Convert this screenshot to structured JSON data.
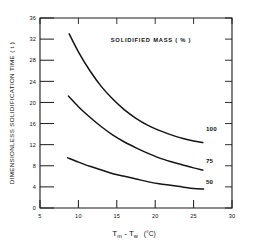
{
  "chart_data": {
    "type": "line",
    "title": "SOLIDIFIED MASS  ( % )",
    "xlabel_main": "T",
    "xlabel_sub1": "m",
    "xlabel_dash": " - T",
    "xlabel_sub2": "w",
    "xlabel_unit": "(°C)",
    "xlabel_full": "Tm - Tw  (°C)",
    "ylabel": "DIMENSIONLESS SOLIDIFICATION TIME ( t )",
    "xlim": [
      5,
      30
    ],
    "ylim": [
      0,
      36
    ],
    "grid": false,
    "legend_position": "inline-right-of-curve-ends",
    "xticks": [
      5,
      10,
      15,
      20,
      25,
      30
    ],
    "xtick_labels": [
      "5",
      "10",
      "15",
      "20",
      "25",
      "30"
    ],
    "yticks": [
      0,
      4,
      8,
      12,
      16,
      20,
      24,
      28,
      32,
      36
    ],
    "ytick_labels": [
      "0",
      "4",
      "8",
      "12",
      "16",
      "20",
      "24",
      "28",
      "32",
      "36"
    ],
    "series": [
      {
        "name": "100",
        "label": "100",
        "label_x": 26.6,
        "label_y": 14.6,
        "x": [
          8.8,
          10.0,
          11.5,
          13.0,
          14.5,
          16.0,
          17.5,
          19.0,
          20.5,
          22.0,
          23.5,
          25.0,
          26.2
        ],
        "values": [
          33.0,
          29.6,
          26.0,
          23.0,
          20.6,
          18.6,
          17.0,
          15.7,
          14.7,
          13.9,
          13.2,
          12.7,
          12.4
        ]
      },
      {
        "name": "75",
        "label": "75",
        "label_x": 26.6,
        "label_y": 8.6,
        "x": [
          8.7,
          10.0,
          11.5,
          13.0,
          14.5,
          16.0,
          17.5,
          19.0,
          20.5,
          22.0,
          23.5,
          25.0,
          26.2
        ],
        "values": [
          21.2,
          19.2,
          17.2,
          15.4,
          13.8,
          12.5,
          11.4,
          10.4,
          9.5,
          8.8,
          8.2,
          7.6,
          7.2
        ]
      },
      {
        "name": "50",
        "label": "50",
        "label_x": 26.6,
        "label_y": 4.5,
        "x": [
          8.6,
          10.0,
          11.5,
          13.0,
          14.5,
          16.0,
          17.5,
          19.0,
          20.5,
          22.0,
          23.5,
          25.0,
          26.3
        ],
        "values": [
          9.5,
          8.7,
          7.9,
          7.2,
          6.5,
          6.0,
          5.5,
          5.0,
          4.6,
          4.3,
          4.0,
          3.7,
          3.6
        ]
      }
    ]
  }
}
